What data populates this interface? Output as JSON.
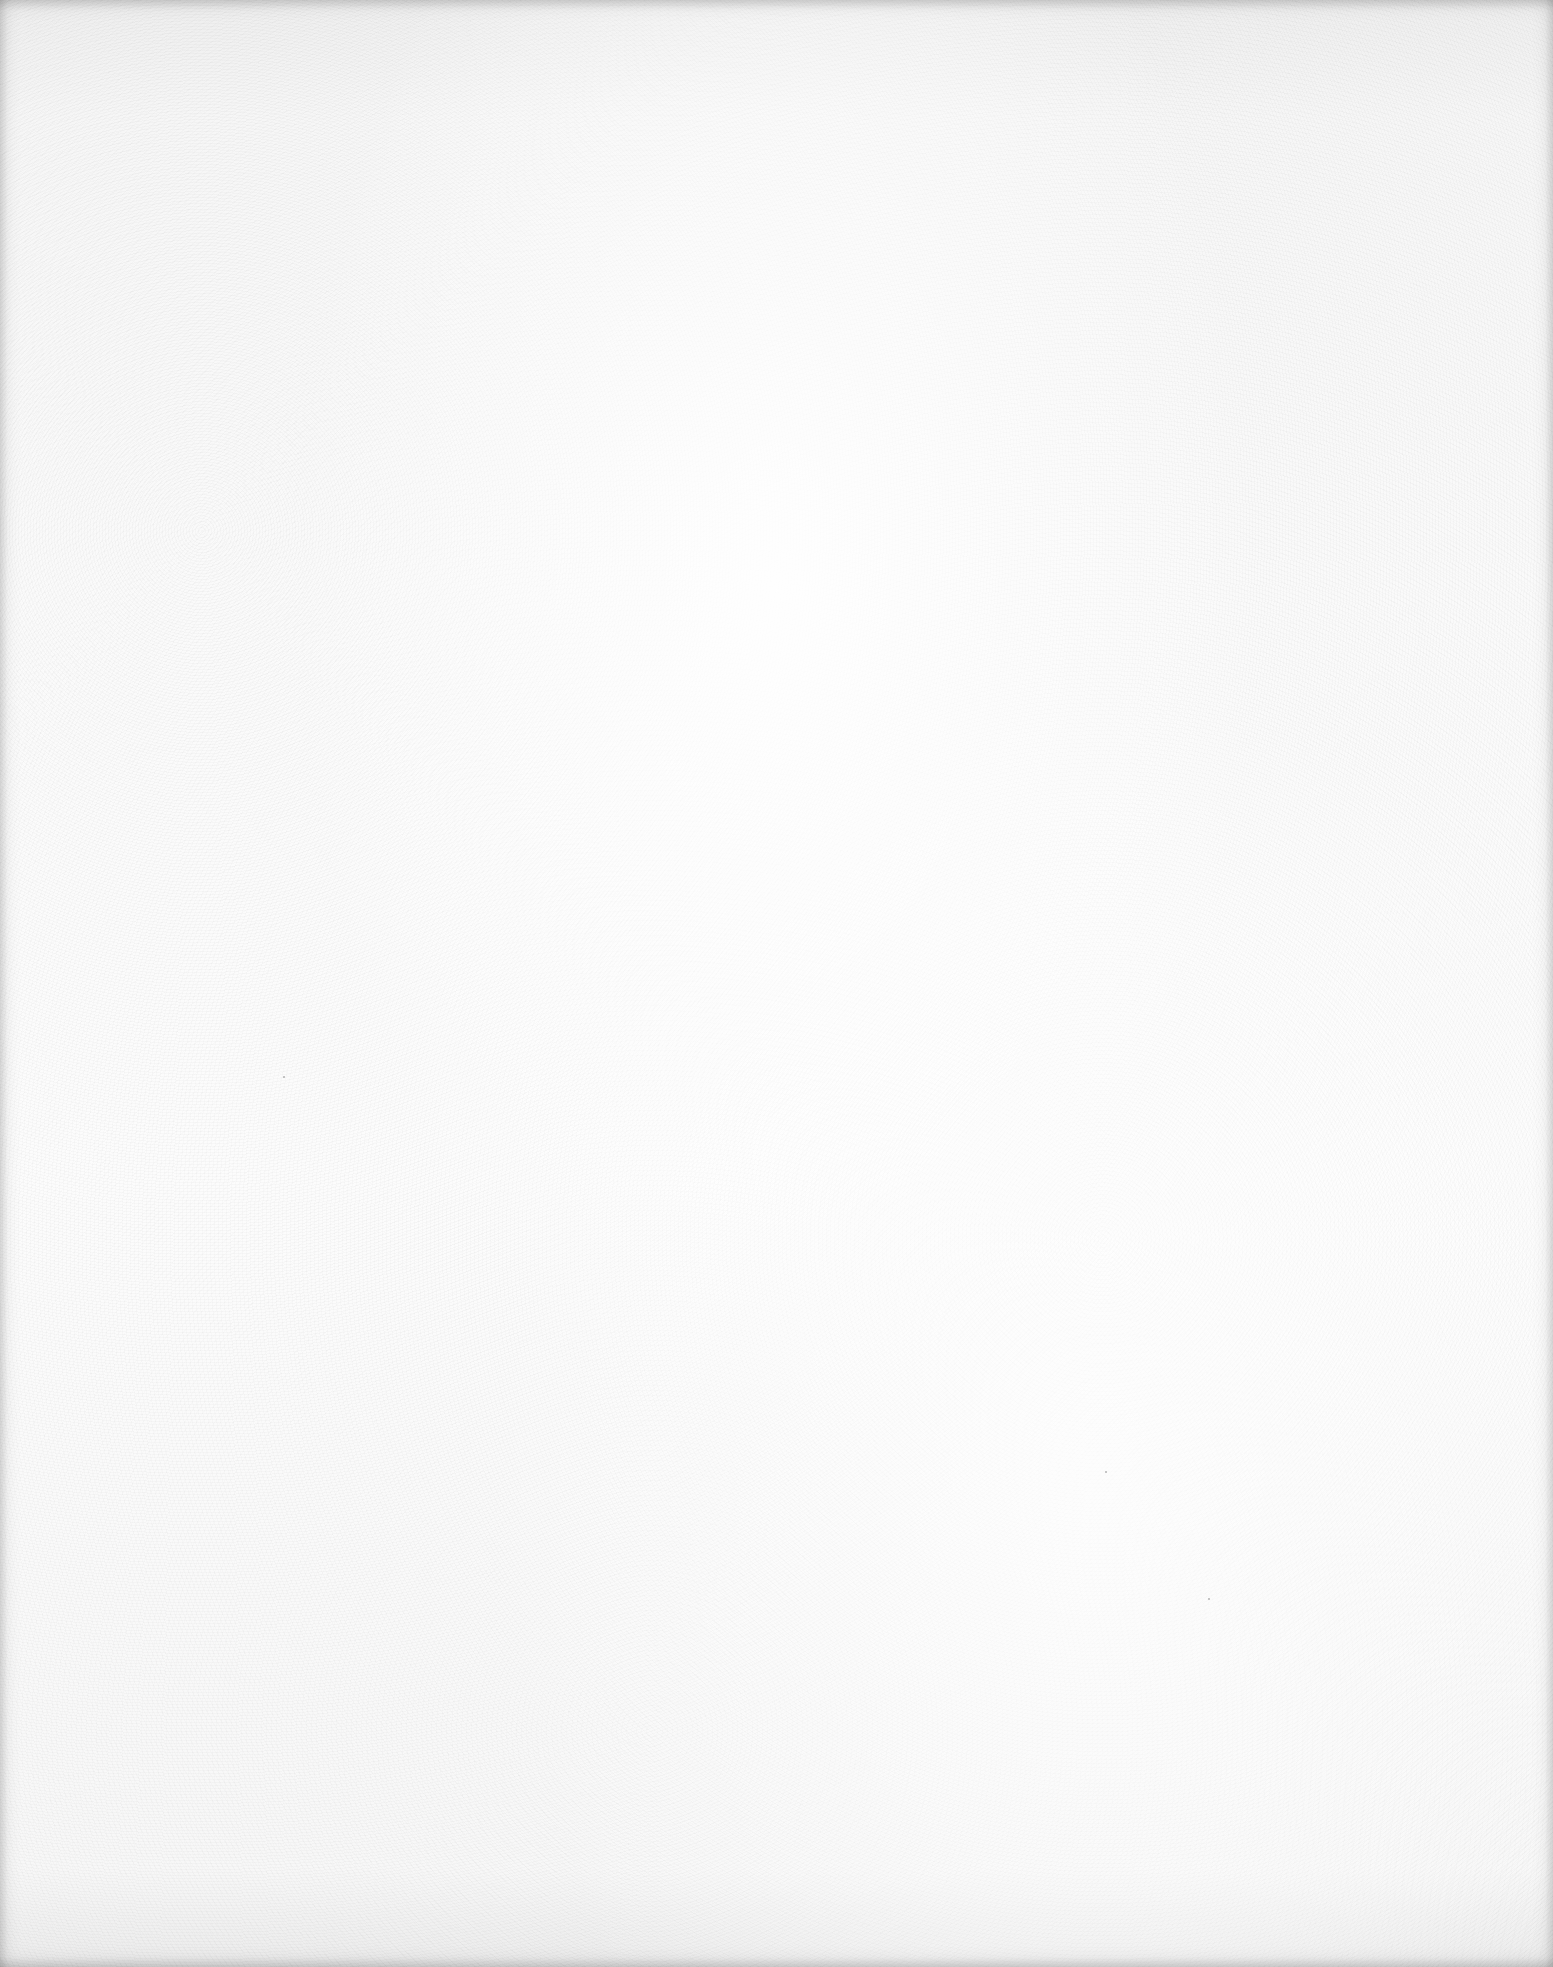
{
  "page": {
    "type": "blank-scanned-page",
    "background_color": "#fbfbfb",
    "edge_shade_color": "#ebebeb",
    "text_content": []
  }
}
